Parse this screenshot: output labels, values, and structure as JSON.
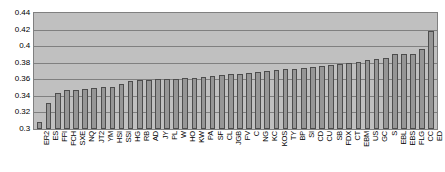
{
  "chart_data": {
    "type": "bar",
    "title": "",
    "subtitle": "",
    "xlabel": "",
    "ylabel": "",
    "ylim": [
      0.3,
      0.44
    ],
    "ytick_labels": [
      "0.44",
      "0.42",
      "0.4",
      "0.38",
      "0.36",
      "0.34",
      "0.32",
      "0.3"
    ],
    "ytick_values": [
      0.44,
      0.42,
      0.4,
      0.38,
      0.36,
      0.34,
      0.32,
      0.3
    ],
    "grid": true,
    "legend": null,
    "legend_position": "none",
    "categories": [
      "ER2",
      "ES",
      "FFI",
      "FCH",
      "SXE",
      "NQ",
      "JT2",
      "YM",
      "HSI",
      "SSI",
      "HG",
      "RB",
      "AD",
      "JY",
      "PL",
      "W",
      "HO",
      "KW",
      "PA",
      "SF",
      "CL",
      "JGB",
      "FV",
      "C",
      "NG",
      "KC",
      "KOS",
      "TY",
      "BP",
      "SI",
      "CD",
      "CU",
      "SB",
      "FDX",
      "CT",
      "EBM",
      "US",
      "GC",
      "S",
      "EBL",
      "EBS",
      "FLG",
      "CC",
      "ED"
    ],
    "values": [
      0.309,
      0.331,
      0.344,
      0.347,
      0.347,
      0.348,
      0.35,
      0.351,
      0.351,
      0.354,
      0.358,
      0.359,
      0.359,
      0.36,
      0.36,
      0.36,
      0.361,
      0.362,
      0.363,
      0.364,
      0.365,
      0.366,
      0.367,
      0.368,
      0.369,
      0.37,
      0.371,
      0.372,
      0.373,
      0.374,
      0.375,
      0.376,
      0.377,
      0.379,
      0.38,
      0.381,
      0.383,
      0.385,
      0.386,
      0.39,
      0.391,
      0.391,
      0.397,
      0.418
    ],
    "colors": {
      "bar_fill": "#969696",
      "bar_border": "#4d4d4d",
      "plot_background": "#c0c0c0",
      "gridline": "#808080",
      "axis_border": "#808080",
      "page_background": "#ffffff",
      "text": "#000000"
    }
  }
}
